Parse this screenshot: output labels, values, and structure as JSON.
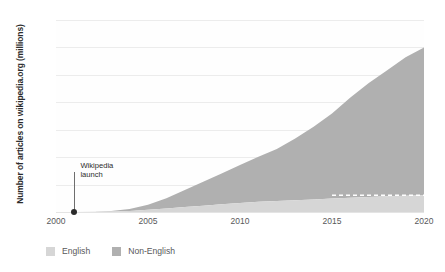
{
  "chart_data": {
    "type": "area",
    "stacked": true,
    "title": "",
    "subtitle": "",
    "xlabel": "",
    "ylabel": "Number of articles on wikipedia.org (millions)",
    "xlim": [
      2000,
      2020
    ],
    "ylim": [
      0,
      70
    ],
    "grid": true,
    "legend_position": "bottom-left",
    "x_ticks": [
      "2000",
      "2005",
      "2010",
      "2015",
      "2020"
    ],
    "y_ticks": [
      "0",
      "10",
      "20",
      "30",
      "40",
      "50",
      "60",
      "70"
    ],
    "x": [
      2000,
      2001,
      2002,
      2003,
      2004,
      2005,
      2006,
      2007,
      2008,
      2009,
      2010,
      2011,
      2012,
      2013,
      2014,
      2015,
      2016,
      2017,
      2018,
      2019,
      2020
    ],
    "series": [
      {
        "name": "English",
        "color": "#d6d6d6",
        "values": [
          0,
          0,
          0.05,
          0.15,
          0.4,
          0.8,
          1.3,
          1.8,
          2.3,
          2.8,
          3.3,
          3.7,
          4.0,
          4.3,
          4.6,
          4.9,
          5.2,
          5.5,
          5.7,
          5.9,
          6.1
        ]
      },
      {
        "name": "Non-English",
        "color": "#b0b0b0",
        "values": [
          0,
          0,
          0.05,
          0.2,
          0.7,
          1.8,
          3.7,
          6.2,
          8.7,
          11.2,
          13.8,
          16.4,
          19.0,
          22.5,
          26.5,
          31.0,
          36.5,
          41.5,
          46.0,
          50.5,
          53.9
        ]
      }
    ],
    "totals": [
      0,
      0,
      0.1,
      0.35,
      1.1,
      2.6,
      5.0,
      8.0,
      11.0,
      14.0,
      17.1,
      20.1,
      23.0,
      26.8,
      31.1,
      35.9,
      41.7,
      47.0,
      51.7,
      56.4,
      60.0
    ],
    "annotations": [
      {
        "name": "wikipedia-launch",
        "label_line_1": "Wikipedia",
        "label_line_2": "launch",
        "x": 2001,
        "y": 0
      }
    ],
    "reference_line": {
      "name": "english-plateau-dashed",
      "style": "dashed",
      "color": "#ffffff",
      "x_start": 2015,
      "x_end": 2020,
      "y": 6.1
    }
  },
  "legend": {
    "items": [
      {
        "label": "English",
        "color": "#d6d6d6"
      },
      {
        "label": "Non-English",
        "color": "#b0b0b0"
      }
    ]
  }
}
